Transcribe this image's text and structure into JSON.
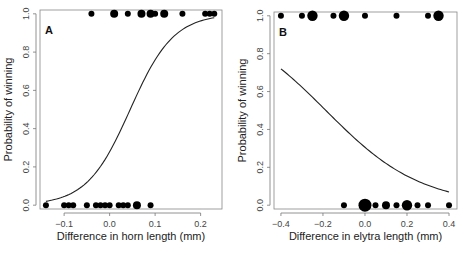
{
  "chart_data": [
    {
      "type": "scatter",
      "panel_label": "A",
      "xlabel": "Difference in horn length (mm)",
      "ylabel": "Probability of winning",
      "xlim": [
        -0.153,
        0.247
      ],
      "ylim": [
        -0.02,
        1.02
      ],
      "xticks": [
        -0.1,
        0.0,
        0.1,
        0.2
      ],
      "xtick_labels": [
        "−0.1",
        "0.0",
        "0.1",
        "0.2"
      ],
      "yticks": [
        0.0,
        0.2,
        0.4,
        0.6,
        0.8,
        1.0
      ],
      "ytick_labels": [
        "0.0",
        "0.2",
        "0.4",
        "0.6",
        "0.8",
        "1.0"
      ],
      "grid": false,
      "points": [
        {
          "x": -0.04,
          "y": 1,
          "size": 1
        },
        {
          "x": 0.01,
          "y": 1,
          "size": 2
        },
        {
          "x": 0.04,
          "y": 1,
          "size": 1
        },
        {
          "x": 0.07,
          "y": 1,
          "size": 2
        },
        {
          "x": 0.09,
          "y": 1,
          "size": 2
        },
        {
          "x": 0.1,
          "y": 1,
          "size": 1
        },
        {
          "x": 0.12,
          "y": 1,
          "size": 2
        },
        {
          "x": 0.16,
          "y": 1,
          "size": 1
        },
        {
          "x": 0.21,
          "y": 1,
          "size": 1
        },
        {
          "x": 0.22,
          "y": 1,
          "size": 1
        },
        {
          "x": 0.23,
          "y": 1,
          "size": 1
        },
        {
          "x": -0.14,
          "y": 0,
          "size": 1
        },
        {
          "x": -0.1,
          "y": 0,
          "size": 1
        },
        {
          "x": -0.09,
          "y": 0,
          "size": 1
        },
        {
          "x": -0.08,
          "y": 0,
          "size": 1
        },
        {
          "x": -0.05,
          "y": 0,
          "size": 1
        },
        {
          "x": -0.03,
          "y": 0,
          "size": 1
        },
        {
          "x": -0.02,
          "y": 0,
          "size": 1
        },
        {
          "x": -0.01,
          "y": 0,
          "size": 1
        },
        {
          "x": 0.0,
          "y": 0,
          "size": 1
        },
        {
          "x": 0.02,
          "y": 0,
          "size": 1
        },
        {
          "x": 0.03,
          "y": 0,
          "size": 1
        },
        {
          "x": 0.04,
          "y": 0,
          "size": 1
        },
        {
          "x": 0.06,
          "y": 0,
          "size": 2
        },
        {
          "x": 0.09,
          "y": 0,
          "size": 1
        }
      ],
      "fit_curve": {
        "type": "logistic",
        "intercept": -0.95,
        "slope": 21.0,
        "x_range": [
          -0.14,
          0.23
        ]
      }
    },
    {
      "type": "scatter",
      "panel_label": "B",
      "xlabel": "Difference in elytra length (mm)",
      "ylabel": "Probability of winning",
      "xlim": [
        -0.433,
        0.438
      ],
      "ylim": [
        -0.02,
        1.02
      ],
      "xticks": [
        -0.4,
        -0.2,
        0.0,
        0.2,
        0.4
      ],
      "xtick_labels": [
        "−0.4",
        "−0.2",
        "0.0",
        "0.2",
        "0.4"
      ],
      "yticks": [
        0.0,
        0.2,
        0.4,
        0.6,
        0.8,
        1.0
      ],
      "ytick_labels": [
        "0.0",
        "0.2",
        "0.4",
        "0.6",
        "0.8",
        "1.0"
      ],
      "grid": false,
      "points": [
        {
          "x": -0.4,
          "y": 1,
          "size": 1
        },
        {
          "x": -0.3,
          "y": 1,
          "size": 1
        },
        {
          "x": -0.25,
          "y": 1,
          "size": 3
        },
        {
          "x": -0.15,
          "y": 1,
          "size": 1
        },
        {
          "x": -0.1,
          "y": 1,
          "size": 3
        },
        {
          "x": 0.0,
          "y": 1,
          "size": 1
        },
        {
          "x": 0.15,
          "y": 1,
          "size": 1
        },
        {
          "x": 0.3,
          "y": 1,
          "size": 1
        },
        {
          "x": 0.35,
          "y": 1,
          "size": 3
        },
        {
          "x": -0.1,
          "y": 0,
          "size": 1
        },
        {
          "x": 0.0,
          "y": 0,
          "size": 4
        },
        {
          "x": 0.05,
          "y": 0,
          "size": 1
        },
        {
          "x": 0.1,
          "y": 0,
          "size": 2
        },
        {
          "x": 0.15,
          "y": 0,
          "size": 1
        },
        {
          "x": 0.2,
          "y": 0,
          "size": 3
        },
        {
          "x": 0.25,
          "y": 0,
          "size": 1
        },
        {
          "x": 0.3,
          "y": 0,
          "size": 1
        },
        {
          "x": 0.4,
          "y": 0,
          "size": 1
        }
      ],
      "fit_curve": {
        "type": "logistic",
        "intercept": -0.82,
        "slope": -4.41,
        "x_range": [
          -0.4,
          0.4
        ]
      }
    }
  ]
}
